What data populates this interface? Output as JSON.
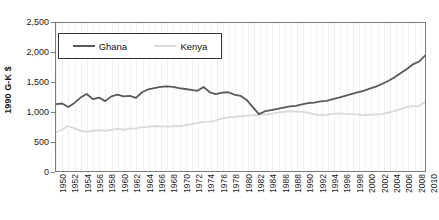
{
  "chart_data": {
    "type": "line",
    "title": "",
    "xlabel": "",
    "ylabel": "1990 G-K $",
    "ylim": [
      0,
      2500
    ],
    "ytick_step": 500,
    "xlim": [
      1950,
      2010
    ],
    "xtick_step": 2,
    "grid": "vertical-only",
    "legend_position": "top-left-inside",
    "y_tick_labels": [
      "0",
      "500",
      "1,000",
      "1,500",
      "2,000",
      "2,500"
    ],
    "y_tick_values": [
      0,
      500,
      1000,
      1500,
      2000,
      2500
    ],
    "x_tick_labels": [
      "1950",
      "1952",
      "1954",
      "1956",
      "1958",
      "1960",
      "1962",
      "1964",
      "1966",
      "1968",
      "1970",
      "1972",
      "1974",
      "1976",
      "1978",
      "1980",
      "1982",
      "1984",
      "1986",
      "1988",
      "1990",
      "1992",
      "1994",
      "1996",
      "1998",
      "2000",
      "2002",
      "2004",
      "2006",
      "2008",
      "2010"
    ],
    "x": [
      1950,
      1951,
      1952,
      1953,
      1954,
      1955,
      1956,
      1957,
      1958,
      1959,
      1960,
      1961,
      1962,
      1963,
      1964,
      1965,
      1966,
      1967,
      1968,
      1969,
      1970,
      1971,
      1972,
      1973,
      1974,
      1975,
      1976,
      1977,
      1978,
      1979,
      1980,
      1981,
      1982,
      1983,
      1984,
      1985,
      1986,
      1987,
      1988,
      1989,
      1990,
      1991,
      1992,
      1993,
      1994,
      1995,
      1996,
      1997,
      1998,
      1999,
      2000,
      2001,
      2002,
      2003,
      2004,
      2005,
      2006,
      2007,
      2008,
      2009,
      2010
    ],
    "series": [
      {
        "name": "Ghana",
        "color": "#595959",
        "values": [
          1130,
          1140,
          1080,
          1150,
          1240,
          1300,
          1215,
          1240,
          1180,
          1260,
          1290,
          1260,
          1270,
          1235,
          1330,
          1380,
          1400,
          1420,
          1430,
          1420,
          1400,
          1385,
          1370,
          1355,
          1420,
          1330,
          1300,
          1325,
          1330,
          1290,
          1270,
          1200,
          1080,
          960,
          1010,
          1030,
          1050,
          1070,
          1090,
          1100,
          1125,
          1145,
          1155,
          1175,
          1185,
          1215,
          1240,
          1270,
          1300,
          1330,
          1355,
          1390,
          1425,
          1470,
          1520,
          1580,
          1650,
          1720,
          1800,
          1845,
          1950
        ]
      },
      {
        "name": "Kenya",
        "color": "#d9d9d9",
        "values": [
          650,
          700,
          760,
          720,
          680,
          665,
          680,
          690,
          680,
          695,
          710,
          700,
          715,
          720,
          740,
          745,
          760,
          755,
          750,
          755,
          760,
          770,
          790,
          810,
          830,
          835,
          855,
          890,
          905,
          915,
          925,
          935,
          945,
          950,
          955,
          965,
          985,
          1000,
          1010,
          1005,
          1000,
          985,
          955,
          945,
          950,
          965,
          975,
          965,
          960,
          955,
          945,
          950,
          955,
          960,
          985,
          1010,
          1045,
          1080,
          1095,
          1100,
          1160
        ]
      }
    ]
  },
  "legend": {
    "items": [
      {
        "label": "Ghana",
        "color": "#595959"
      },
      {
        "label": "Kenya",
        "color": "#d9d9d9"
      }
    ]
  }
}
